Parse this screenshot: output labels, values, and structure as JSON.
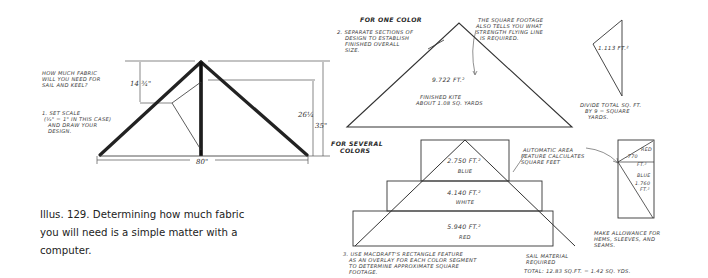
{
  "figure": {
    "caption_lines": [
      "Illus. 129. Determining how much fabric",
      "you will need is a simple matter with a",
      "computer."
    ]
  },
  "left_drawing": {
    "question": [
      "HOW MUCH FABRIC",
      "WILL YOU NEED FOR",
      "SAIL AND KEEL?"
    ],
    "step1": [
      "1. SET SCALE",
      "(¼\" = 1\" IN THIS CASE)",
      "AND DRAW YOUR",
      "DESIGN."
    ],
    "dim_keel_depth": "14 ¾\"",
    "dim_height_inner": "26¼",
    "dim_height_outer": "35\"",
    "dim_width": "80\""
  },
  "one_color": {
    "heading": "FOR ONE COLOR",
    "step2": [
      "2. SEPARATE SECTIONS OF",
      "DESIGN TO ESTABLISH",
      "FINISHED OVERALL",
      "SIZE."
    ],
    "note_square_footage": [
      "THE SQUARE FOOTAGE",
      "ALSO TELLS YOU WHAT",
      "STRENGTH FLYING LINE",
      "IS REQUIRED."
    ],
    "sail_area": "9.722 FT.²",
    "finished_kite": [
      "FINISHED KITE",
      "ABOUT 1.08 SQ. YARDS"
    ],
    "keel_area": "1.113 FT.²",
    "divide_note": [
      "DIVIDE TOTAL SQ. FT.",
      "BY 9 = SQUARE",
      "YARDS."
    ]
  },
  "several_colors": {
    "heading": [
      "FOR SEVERAL",
      "COLORS"
    ],
    "bands": [
      {
        "area": "2.750 FT.²",
        "color": "BLUE"
      },
      {
        "area": "4.140 FT.²",
        "color": "WHITE"
      },
      {
        "area": "5.940 FT.²",
        "color": "RED"
      }
    ],
    "auto_area_note": [
      "AUTOMATIC AREA",
      "FEATURE CALCULATES",
      "SQUARE FEET"
    ],
    "keel_red_label": "RED",
    "keel_red_area": ".770",
    "keel_red_unit": "FT.²",
    "keel_blue_label": "BLUE",
    "keel_blue_area": "1.760",
    "keel_blue_unit": "FT.²",
    "step3": [
      "3. USE MACDRAFT'S RECTANGLE FEATURE",
      "AS AN OVERLAY FOR EACH COLOR SEGMENT",
      "TO DETERMINE APPROXIMATE SQUARE",
      "FOOTAGE."
    ],
    "allowance_note": [
      "MAKE ALLOWANCE FOR",
      "HEMS, SLEEVES, AND",
      "SEAMS."
    ],
    "sail_material": [
      "SAIL MATERIAL",
      "REQUIRED"
    ],
    "total": "TOTAL: 12.83 SQ.FT. = 1.42 SQ. YDS."
  }
}
